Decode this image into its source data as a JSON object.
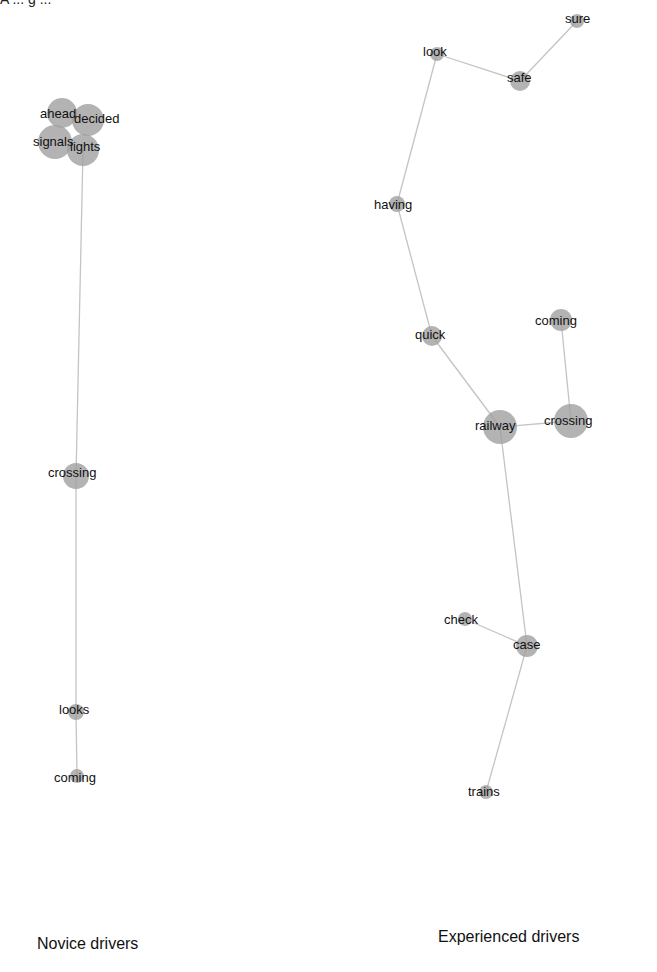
{
  "header": {
    "cut_text_left": "A ... g ...",
    "cut_text_right": "g"
  },
  "panels": [
    {
      "caption": "Novice drivers",
      "nodes": [
        {
          "id": "ahead",
          "label": "ahead",
          "x": 62,
          "y": 113,
          "r": 15,
          "lx": 40,
          "ly": 114
        },
        {
          "id": "decided",
          "label": "decided",
          "x": 88,
          "y": 120,
          "r": 16,
          "lx": 74,
          "ly": 119
        },
        {
          "id": "signals",
          "label": "signals",
          "x": 55,
          "y": 142,
          "r": 17,
          "lx": 33,
          "ly": 142
        },
        {
          "id": "lights",
          "label": "lights",
          "x": 83,
          "y": 150,
          "r": 16,
          "lx": 70,
          "ly": 147
        },
        {
          "id": "crossing",
          "label": "crossing",
          "x": 76,
          "y": 476,
          "r": 13,
          "lx": 48,
          "ly": 473
        },
        {
          "id": "looks",
          "label": "looks",
          "x": 76,
          "y": 712,
          "r": 8,
          "lx": 59,
          "ly": 710
        },
        {
          "id": "coming",
          "label": "coming",
          "x": 77,
          "y": 776,
          "r": 7,
          "lx": 54,
          "ly": 778
        }
      ],
      "edges": [
        [
          "lights",
          "crossing"
        ],
        [
          "crossing",
          "looks"
        ],
        [
          "looks",
          "coming"
        ]
      ]
    },
    {
      "caption": "Experienced drivers",
      "nodes": [
        {
          "id": "sure",
          "label": "sure",
          "x": 577,
          "y": 21,
          "r": 7,
          "lx": 565,
          "ly": 19
        },
        {
          "id": "look",
          "label": "look",
          "x": 437,
          "y": 54,
          "r": 7,
          "lx": 423,
          "ly": 52
        },
        {
          "id": "safe",
          "label": "safe",
          "x": 520,
          "y": 81,
          "r": 10,
          "lx": 507,
          "ly": 78
        },
        {
          "id": "having",
          "label": "having",
          "x": 397,
          "y": 204,
          "r": 8,
          "lx": 374,
          "ly": 205
        },
        {
          "id": "quick",
          "label": "quick",
          "x": 432,
          "y": 336,
          "r": 10,
          "lx": 415,
          "ly": 335
        },
        {
          "id": "coming",
          "label": "coming",
          "x": 561,
          "y": 320,
          "r": 11,
          "lx": 535,
          "ly": 321
        },
        {
          "id": "railway",
          "label": "railway",
          "x": 500,
          "y": 427,
          "r": 17,
          "lx": 475,
          "ly": 426
        },
        {
          "id": "crossing",
          "label": "crossing",
          "x": 571,
          "y": 421,
          "r": 17,
          "lx": 544,
          "ly": 421
        },
        {
          "id": "check",
          "label": "check",
          "x": 465,
          "y": 619,
          "r": 7,
          "lx": 444,
          "ly": 620
        },
        {
          "id": "case",
          "label": "case",
          "x": 527,
          "y": 646,
          "r": 11,
          "lx": 513,
          "ly": 645
        },
        {
          "id": "trains",
          "label": "trains",
          "x": 486,
          "y": 792,
          "r": 7,
          "lx": 468,
          "ly": 792
        }
      ],
      "edges": [
        [
          "sure",
          "safe"
        ],
        [
          "look",
          "safe"
        ],
        [
          "look",
          "having"
        ],
        [
          "having",
          "quick"
        ],
        [
          "quick",
          "railway"
        ],
        [
          "coming",
          "crossing"
        ],
        [
          "railway",
          "crossing"
        ],
        [
          "railway",
          "case"
        ],
        [
          "check",
          "case"
        ],
        [
          "case",
          "trains"
        ]
      ]
    }
  ],
  "colors": {
    "node": "#9e9e9e",
    "edge": "#c4c4c4",
    "text": "#111111",
    "background": "#ffffff"
  }
}
